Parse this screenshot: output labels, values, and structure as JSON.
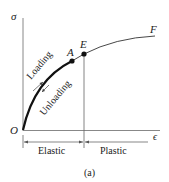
{
  "diagram": {
    "axes": {
      "y_label": "σ",
      "x_label": "ϵ",
      "origin_label": "O"
    },
    "points": [
      {
        "label": "A",
        "x": 72,
        "y": 61
      },
      {
        "label": "E",
        "x": 84,
        "y": 54
      }
    ],
    "curve_end_label": "F",
    "curve_labels": {
      "loading": "Loading",
      "unloading": "Unloading"
    },
    "regions": {
      "elastic": "Elastic",
      "plastic": "Plastic"
    },
    "caption": "(a)",
    "colors": {
      "line": "#333333",
      "thick": "#111111",
      "axis": "#888888"
    }
  }
}
